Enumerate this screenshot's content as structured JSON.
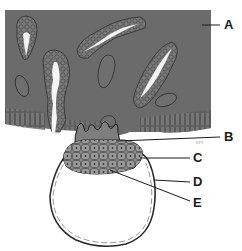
{
  "diagram": {
    "labels": [
      {
        "id": "A",
        "text": "A",
        "x": 224,
        "y": 17
      },
      {
        "id": "B",
        "text": "B",
        "x": 224,
        "y": 129
      },
      {
        "id": "C",
        "text": "C",
        "x": 193,
        "y": 150
      },
      {
        "id": "D",
        "text": "D",
        "x": 193,
        "y": 176
      },
      {
        "id": "E",
        "text": "E",
        "x": 193,
        "y": 196
      }
    ],
    "artist_signature": "KFT",
    "colors": {
      "endometrium": "#6b6b6b",
      "gland_wall": "#7a7a7a",
      "gland_lumen": "#f2f2f2",
      "inner_cell_mass": "#8c8c8c",
      "outline": "#2a2a2a",
      "background": "#ffffff"
    }
  }
}
